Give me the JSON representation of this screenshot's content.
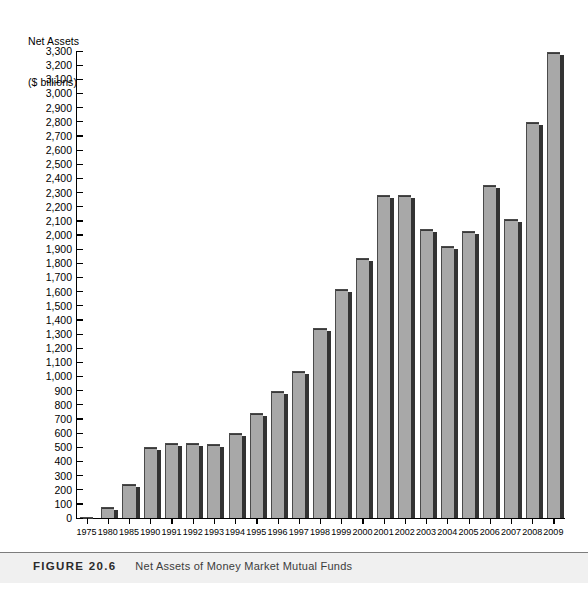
{
  "figure": {
    "number_label": "FIGURE 20.6",
    "caption": "Net Assets of Money Market Mutual Funds"
  },
  "axis_title_line1": "Net Assets",
  "axis_title_line2": "($ billions)",
  "chart_data": {
    "type": "bar",
    "title": "Net Assets of Money Market Mutual Funds",
    "xlabel": "",
    "ylabel": "Net Assets ($ billions)",
    "ylim": [
      0,
      3300
    ],
    "ytick_step": 100,
    "grid": false,
    "legend": null,
    "categories": [
      "1975",
      "1980",
      "1985",
      "1990",
      "1991",
      "1992",
      "1993",
      "1994",
      "1995",
      "1996",
      "1997",
      "1998",
      "1999",
      "2000",
      "2001",
      "2002",
      "2003",
      "2004",
      "2005",
      "2006",
      "2007",
      "2008",
      "2009"
    ],
    "values": [
      5,
      75,
      240,
      500,
      530,
      530,
      520,
      600,
      740,
      900,
      1040,
      1340,
      1620,
      1840,
      2285,
      2280,
      2040,
      1920,
      2030,
      2350,
      2110,
      2800,
      3290
    ],
    "ytick_labels": [
      "3,300",
      "3,200",
      "3,100",
      "3,000",
      "2,900",
      "2,800",
      "2,700",
      "2,600",
      "2,500",
      "2,400",
      "2,300",
      "2,200",
      "2,100",
      "2,000",
      "1,900",
      "1,800",
      "1,700",
      "1,600",
      "1,500",
      "1,400",
      "1,300",
      "1,200",
      "1,100",
      "1,000",
      "900",
      "800",
      "700",
      "600",
      "500",
      "400",
      "300",
      "200",
      "100",
      "0"
    ],
    "bar_color": "#a8a8a8",
    "bar_shadow_color": "#333333",
    "bar_edge_color": "#4a4a4a",
    "axis_color": "#000000"
  }
}
